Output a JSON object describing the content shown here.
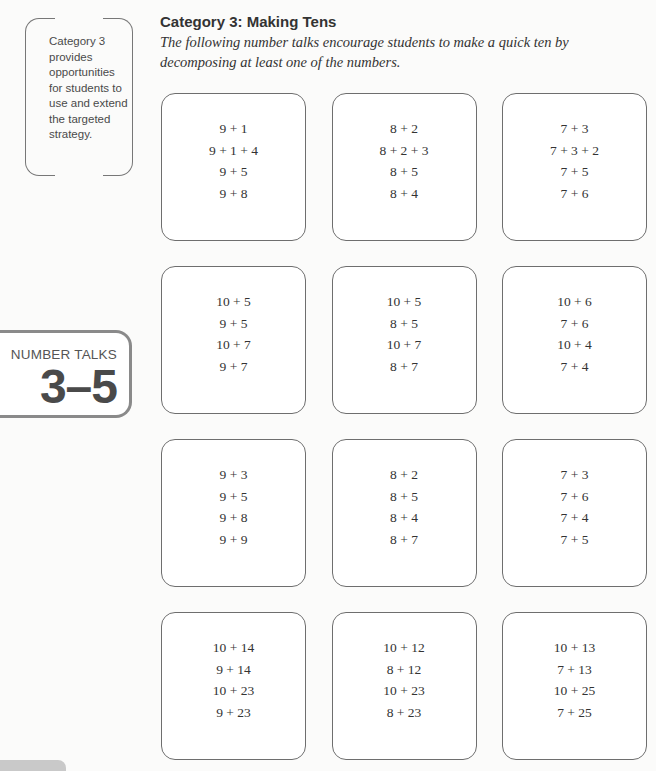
{
  "side_note": {
    "text": "Category 3 provides opportunities for students to use and extend the targeted strategy."
  },
  "badge": {
    "label": "NUMBER TALKS",
    "range": "3–5"
  },
  "header": {
    "title": "Category 3: Making Tens",
    "subtitle": "The following number talks encourage students to make a quick ten by decomposing at least one of the numbers."
  },
  "cards": [
    {
      "problems": [
        "9 + 1",
        "9 + 1 + 4",
        "9 + 5",
        "9 + 8"
      ]
    },
    {
      "problems": [
        "8 + 2",
        "8 + 2 + 3",
        "8 + 5",
        "8 + 4"
      ]
    },
    {
      "problems": [
        "7 + 3",
        "7 + 3 + 2",
        "7 + 5",
        "7 + 6"
      ]
    },
    {
      "problems": [
        "10 + 5",
        "9 + 5",
        "10 + 7",
        "9 + 7"
      ]
    },
    {
      "problems": [
        "10 + 5",
        "8 + 5",
        "10 + 7",
        "8 + 7"
      ]
    },
    {
      "problems": [
        "10 + 6",
        "7 + 6",
        "10 + 4",
        "7 + 4"
      ]
    },
    {
      "problems": [
        "9 + 3",
        "9 + 5",
        "9 + 8",
        "9 + 9"
      ]
    },
    {
      "problems": [
        "8 + 2",
        "8 + 5",
        "8 + 4",
        "8 + 7"
      ]
    },
    {
      "problems": [
        "7 + 3",
        "7 + 6",
        "7 + 4",
        "7 + 5"
      ]
    },
    {
      "problems": [
        "10 + 14",
        "9 + 14",
        "10 + 23",
        "9 + 23"
      ]
    },
    {
      "problems": [
        "10 + 12",
        "8 + 12",
        "10 + 23",
        "8 + 23"
      ]
    },
    {
      "problems": [
        "10 + 13",
        "7 + 13",
        "10 + 25",
        "7 + 25"
      ]
    }
  ]
}
